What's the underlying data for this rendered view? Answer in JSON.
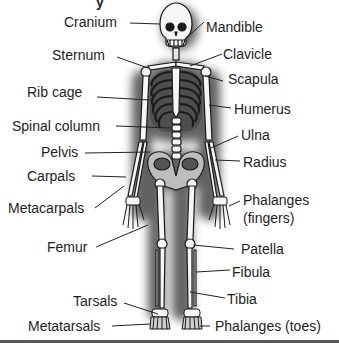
{
  "diagram": {
    "title_fragment": "y",
    "labels_left": [
      {
        "id": "cranium",
        "text": "Cranium"
      },
      {
        "id": "sternum",
        "text": "Sternum"
      },
      {
        "id": "rib-cage",
        "text": "Rib cage"
      },
      {
        "id": "spinal-column",
        "text": "Spinal column"
      },
      {
        "id": "pelvis",
        "text": "Pelvis"
      },
      {
        "id": "carpals",
        "text": "Carpals"
      },
      {
        "id": "metacarpals",
        "text": "Metacarpals"
      },
      {
        "id": "femur",
        "text": "Femur"
      },
      {
        "id": "tarsals",
        "text": "Tarsals"
      },
      {
        "id": "metatarsals",
        "text": "Metatarsals"
      }
    ],
    "labels_right": [
      {
        "id": "mandible",
        "text": "Mandible"
      },
      {
        "id": "clavicle",
        "text": "Clavicle"
      },
      {
        "id": "scapula",
        "text": "Scapula"
      },
      {
        "id": "humerus",
        "text": "Humerus"
      },
      {
        "id": "ulna",
        "text": "Ulna"
      },
      {
        "id": "radius",
        "text": "Radius"
      },
      {
        "id": "phalanges-fingers",
        "text": "Phalanges\n(fingers)",
        "line1": "Phalanges",
        "line2": "(fingers)"
      },
      {
        "id": "patella",
        "text": "Patella"
      },
      {
        "id": "fibula",
        "text": "Fibula"
      },
      {
        "id": "tibia",
        "text": "Tibia"
      },
      {
        "id": "phalanges-toes",
        "text": "Phalanges (toes)"
      }
    ],
    "colors": {
      "bone": "#f4f4f4",
      "outline": "#1a1a1a",
      "shadow": "#3a3a3a",
      "text": "#1d1d1d",
      "leader": "#222222"
    }
  }
}
